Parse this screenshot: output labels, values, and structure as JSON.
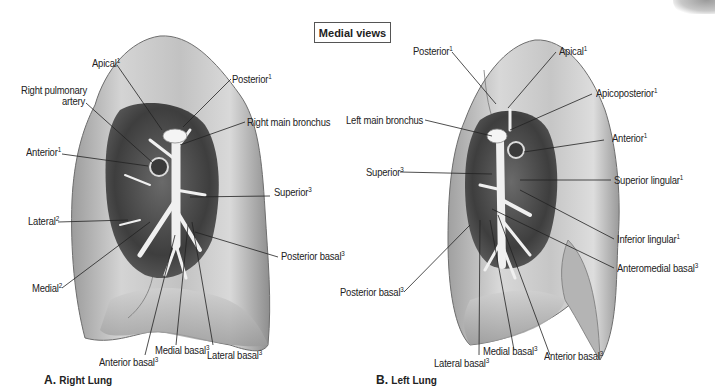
{
  "header": {
    "title": "Medial views"
  },
  "panels": [
    {
      "id": "A",
      "caption_letter": "A.",
      "caption_text": "Right Lung",
      "labels": [
        {
          "text": "Apical",
          "sup": "1"
        },
        {
          "text": "Right pulmonary",
          "sup": ""
        },
        {
          "text": "artery",
          "sup": ""
        },
        {
          "text": "Posterior",
          "sup": "1"
        },
        {
          "text": "Right main bronchus",
          "sup": ""
        },
        {
          "text": "Anterior",
          "sup": "1"
        },
        {
          "text": "Superior",
          "sup": "3"
        },
        {
          "text": "Lateral",
          "sup": "2"
        },
        {
          "text": "Posterior basal",
          "sup": "3"
        },
        {
          "text": "Medial",
          "sup": "2"
        },
        {
          "text": "Medial basal",
          "sup": "3"
        },
        {
          "text": "Lateral basal",
          "sup": "3"
        },
        {
          "text": "Anterior basal",
          "sup": "3"
        }
      ]
    },
    {
      "id": "B",
      "caption_letter": "B.",
      "caption_text": "Left Lung",
      "labels": [
        {
          "text": "Posterior",
          "sup": "1"
        },
        {
          "text": "Apical",
          "sup": "1"
        },
        {
          "text": "Apicoposterior",
          "sup": "1"
        },
        {
          "text": "Left main bronchus",
          "sup": ""
        },
        {
          "text": "Anterior",
          "sup": "1"
        },
        {
          "text": "Superior",
          "sup": "3"
        },
        {
          "text": "Superior lingular",
          "sup": "1"
        },
        {
          "text": "Inferior lingular",
          "sup": "1"
        },
        {
          "text": "Anteromedial basal",
          "sup": "3"
        },
        {
          "text": "Posterior basal",
          "sup": "3"
        },
        {
          "text": "Medial basal",
          "sup": "3"
        },
        {
          "text": "Anterior basal",
          "sup": "3"
        },
        {
          "text": "Lateral basal",
          "sup": "3"
        }
      ]
    }
  ],
  "colors": {
    "lung_surface": "#b9b9b9",
    "lung_highlight": "#e2e2e2",
    "lung_shadow": "#7d7d7d",
    "hilum_dark": "#4a4a4a",
    "bronchus": "#f2f2f2",
    "leader_line": "#222222"
  }
}
